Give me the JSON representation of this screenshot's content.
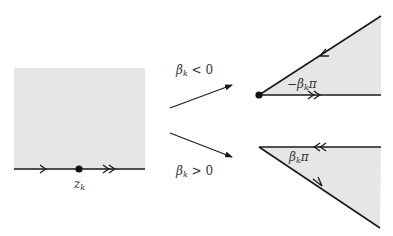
{
  "diagram": {
    "colors": {
      "fill": "#e6e6e6",
      "line": "#1a1a1a",
      "text": "#333333",
      "background": "#ffffff"
    },
    "source": {
      "point_label_base": "z",
      "point_label_sub": "k",
      "arrows": [
        "single-forward",
        "double-forward"
      ]
    },
    "transforms": [
      {
        "condition_base": "β",
        "condition_sub": "k",
        "condition_rest": " < 0",
        "direction": "up"
      },
      {
        "condition_base": "β",
        "condition_sub": "k",
        "condition_rest": " > 0",
        "direction": "down"
      }
    ],
    "wedges": [
      {
        "position": "top",
        "angle_label_prefix": "−",
        "angle_label_base": "β",
        "angle_label_sub": "k",
        "angle_label_suffix": "π",
        "edge_arrows": [
          "single-inward-on-slanted-edge",
          "double-outward-on-horizontal-edge"
        ]
      },
      {
        "position": "bottom",
        "angle_label_prefix": "",
        "angle_label_base": "β",
        "angle_label_sub": "k",
        "angle_label_suffix": "π",
        "edge_arrows": [
          "double-inward-on-horizontal-edge",
          "single-outward-on-slanted-edge"
        ]
      }
    ]
  }
}
